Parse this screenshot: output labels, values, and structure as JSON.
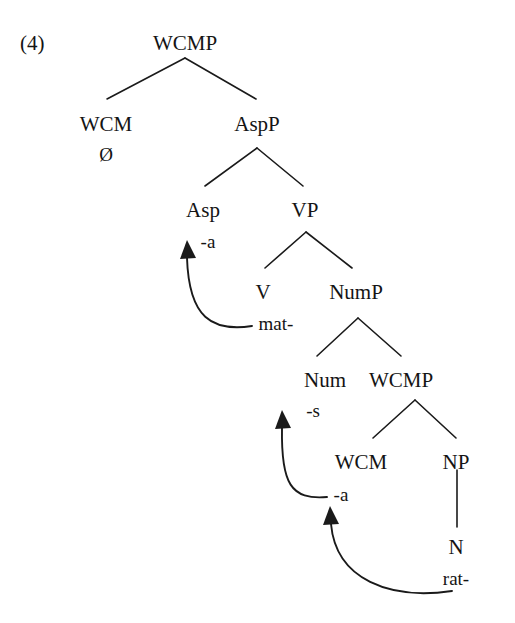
{
  "figure": {
    "example_number": "(4)",
    "type": "syntactic-tree-diagram",
    "ink_color": "#1a1a1a",
    "background_color": "#ffffff"
  },
  "nodes": {
    "root_wcmp": "WCMP",
    "wcm_top": "WCM",
    "wcm_top_terminal": "Ø",
    "aspp": "AspP",
    "asp": "Asp",
    "asp_terminal": "-a",
    "vp": "VP",
    "v": "V",
    "v_terminal": "mat-",
    "nump": "NumP",
    "num": "Num",
    "num_terminal": "-s",
    "inner_wcmp": "WCMP",
    "wcm_inner": "WCM",
    "wcm_inner_terminal": "-a",
    "np": "NP",
    "n": "N",
    "n_terminal": "rat-"
  },
  "movements": [
    {
      "name": "v-to-asp",
      "from": "mat-",
      "to": "-a"
    },
    {
      "name": "wcm-to-num",
      "from": "-a",
      "to": "-s"
    },
    {
      "name": "n-to-wcm",
      "from": "rat-",
      "to": "-a"
    }
  ]
}
